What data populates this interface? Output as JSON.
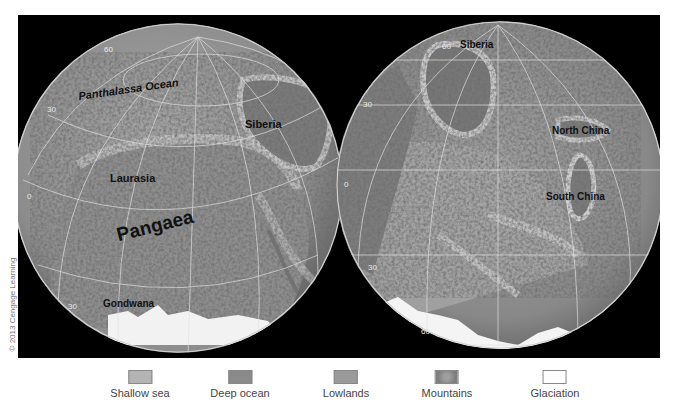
{
  "map": {
    "left_globe": {
      "labels": {
        "ocean": "Panthalassa Ocean",
        "siberia": "Siberia",
        "laurasia": "Laurasia",
        "pangaea": "Pangaea",
        "gondwana": "Gondwana"
      },
      "latitudes": {
        "lat60": "60",
        "lat30n": "30",
        "lat0": "0",
        "lat30s": "30"
      }
    },
    "right_globe": {
      "labels": {
        "siberia": "Siberia",
        "north_china": "North China",
        "south_china": "South China"
      },
      "latitudes": {
        "lat60n": "60",
        "lat30n": "30",
        "lat0": "0",
        "lat30s": "30",
        "lat60s": "60"
      }
    },
    "copyright": "© 2013 Cengage Learning"
  },
  "legend": {
    "items": [
      {
        "label": "Shallow sea",
        "color": "#b4b4b4"
      },
      {
        "label": "Deep ocean",
        "color": "#8a8a8a"
      },
      {
        "label": "Lowlands",
        "color": "#9a9a9a"
      },
      {
        "label": "Mountains",
        "color": "#7e7e7e"
      },
      {
        "label": "Glaciation",
        "color": "#ffffff"
      }
    ]
  }
}
